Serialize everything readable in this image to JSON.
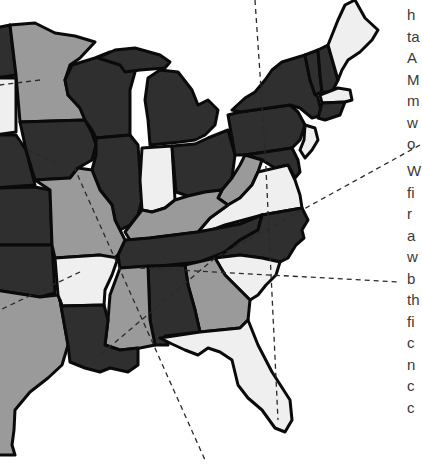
{
  "map": {
    "title": "Eastern United States state shading",
    "shades": {
      "dark": "#2f2f2f",
      "medium": "#9a9a9a",
      "light": "#efefef",
      "border": "#0a0a0a"
    },
    "states": [
      {
        "id": "MN",
        "shade": "medium"
      },
      {
        "id": "WI",
        "shade": "dark"
      },
      {
        "id": "MI",
        "shade": "dark"
      },
      {
        "id": "IA",
        "shade": "dark"
      },
      {
        "id": "IL",
        "shade": "dark"
      },
      {
        "id": "IN",
        "shade": "light"
      },
      {
        "id": "OH",
        "shade": "dark"
      },
      {
        "id": "PA",
        "shade": "dark"
      },
      {
        "id": "NY",
        "shade": "dark"
      },
      {
        "id": "VT",
        "shade": "dark"
      },
      {
        "id": "NH",
        "shade": "dark"
      },
      {
        "id": "ME",
        "shade": "light"
      },
      {
        "id": "MA",
        "shade": "light"
      },
      {
        "id": "CT-RI",
        "shade": "dark"
      },
      {
        "id": "NJ",
        "shade": "light"
      },
      {
        "id": "DE-MD",
        "shade": "dark"
      },
      {
        "id": "WV",
        "shade": "medium"
      },
      {
        "id": "VA",
        "shade": "light"
      },
      {
        "id": "KY",
        "shade": "medium"
      },
      {
        "id": "TN",
        "shade": "dark"
      },
      {
        "id": "NC",
        "shade": "dark"
      },
      {
        "id": "SC",
        "shade": "light"
      },
      {
        "id": "GA",
        "shade": "medium"
      },
      {
        "id": "AL",
        "shade": "dark"
      },
      {
        "id": "MS",
        "shade": "medium"
      },
      {
        "id": "FL",
        "shade": "light"
      },
      {
        "id": "MO",
        "shade": "medium"
      },
      {
        "id": "AR",
        "shade": "light"
      },
      {
        "id": "LA",
        "shade": "dark"
      },
      {
        "id": "TX",
        "shade": "medium"
      },
      {
        "id": "OK",
        "shade": "dark"
      },
      {
        "id": "KS",
        "shade": "dark"
      },
      {
        "id": "NE",
        "shade": "dark"
      },
      {
        "id": "SD",
        "shade": "light"
      },
      {
        "id": "ND",
        "shade": "dark"
      }
    ]
  },
  "side_text": {
    "column1": [
      "h",
      "ta",
      "A",
      "M",
      "m",
      "w",
      "o"
    ],
    "column2": [
      "W",
      "fi",
      "r",
      "a",
      "w",
      "b",
      "th",
      "fi",
      "c",
      "n",
      "c",
      "c"
    ]
  }
}
